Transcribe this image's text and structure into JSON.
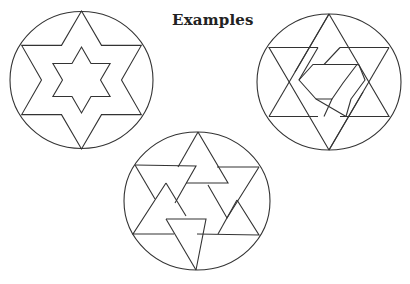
{
  "title": "Examples",
  "colors": {
    "stroke": "#333333",
    "background": "#ffffff",
    "text": "#222222"
  },
  "figures": [
    {
      "name": "nested-hexagram",
      "description": "Circle with a large six-pointed star containing a smaller six-pointed star"
    },
    {
      "name": "interlaced-hexagram",
      "description": "Circle with a banded, interlaced six-pointed star"
    },
    {
      "name": "pinwheel-triangles",
      "description": "Circle with six overlapping triangles arranged in a rotating star pattern"
    }
  ]
}
